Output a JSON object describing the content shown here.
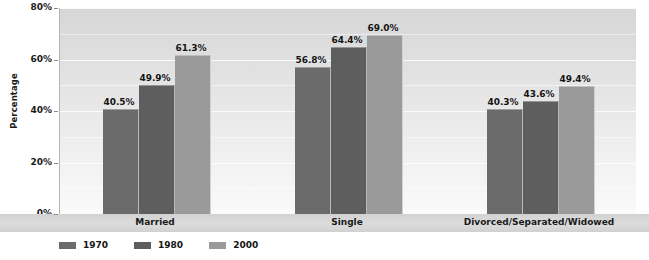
{
  "chart_data": {
    "type": "bar",
    "title": "",
    "xlabel": "",
    "ylabel": "Percentage",
    "ylim": [
      0,
      80
    ],
    "yticks": [
      "0%",
      "20%",
      "40%",
      "60%",
      "80%"
    ],
    "grid": true,
    "legend_position": "bottom-left",
    "categories": [
      "Married",
      "Single",
      "Divorced/Separated/Widowed"
    ],
    "series": [
      {
        "name": "1970",
        "color": "#6b6b6b",
        "values": [
          40.5,
          56.8,
          40.3
        ],
        "labels": [
          "40.5%",
          "56.8%",
          "40.3%"
        ]
      },
      {
        "name": "1980",
        "color": "#5e5e5e",
        "values": [
          49.9,
          64.4,
          43.6
        ],
        "labels": [
          "49.9%",
          "64.4%",
          "43.6%"
        ]
      },
      {
        "name": "2000",
        "color": "#9a9a9a",
        "values": [
          61.3,
          69.0,
          49.4
        ],
        "labels": [
          "61.3%",
          "69.0%",
          "49.4%"
        ]
      }
    ]
  }
}
